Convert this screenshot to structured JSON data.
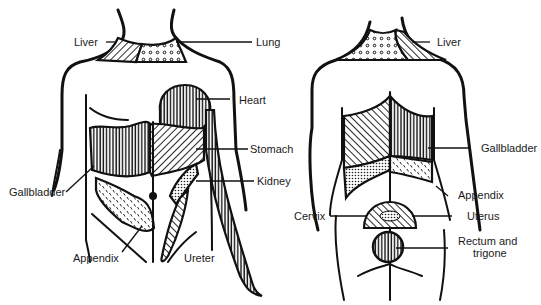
{
  "figure": {
    "front_view": {
      "labels": {
        "liver": "Liver",
        "lung": "Lung",
        "heart": "Heart",
        "stomach": "Stomach",
        "kidney": "Kidney",
        "gallbladder": "Gallbladder",
        "appendix": "Appendix",
        "ureter": "Ureter"
      }
    },
    "back_view": {
      "labels": {
        "liver": "Liver",
        "gallbladder": "Gallbladder",
        "appendix": "Appendix",
        "cervix": "Cervix",
        "uterus": "Uterus",
        "rectum_line1": "Rectum and",
        "rectum_line2": "trigone"
      }
    },
    "colors": {
      "ink": "#111111",
      "background": "#ffffff"
    }
  }
}
